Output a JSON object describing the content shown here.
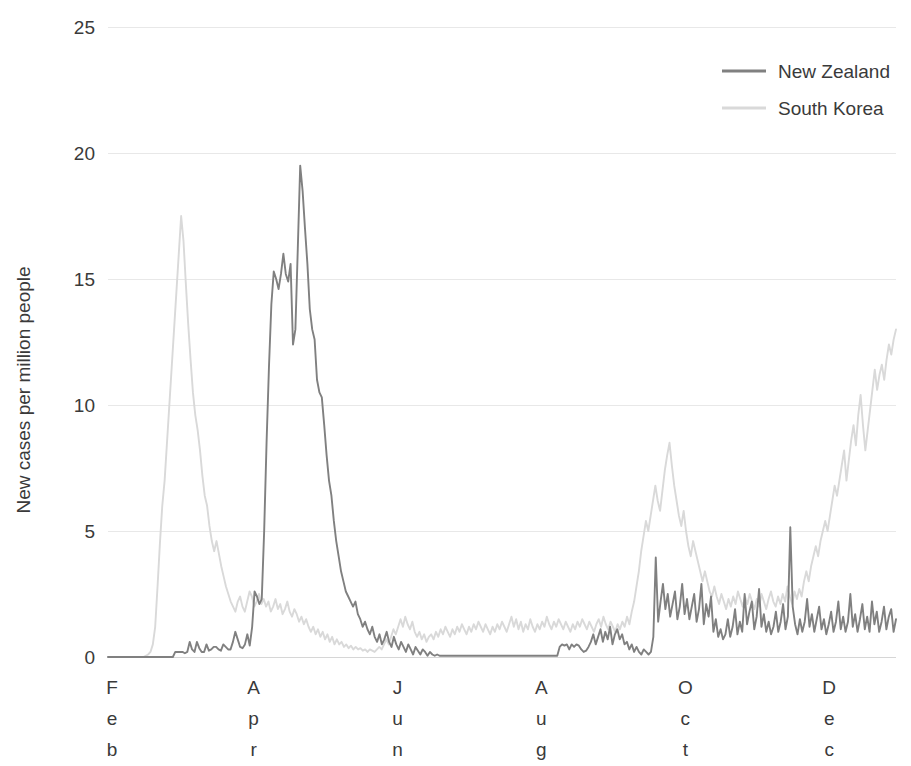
{
  "chart_data": {
    "type": "line",
    "title": "",
    "xlabel": "",
    "ylabel": "New cases per million people",
    "ylim": [
      0,
      25
    ],
    "yticks": [
      0,
      5,
      10,
      15,
      20,
      25
    ],
    "ytick_labels": [
      "0",
      "5",
      "10",
      "15",
      "20",
      "25"
    ],
    "grid": true,
    "grid_axis": "y",
    "legend_position": "top-right",
    "x_axis_type": "date",
    "x_range": [
      "2020-02-01",
      "2020-12-31"
    ],
    "xtick_labels": [
      "Feb",
      "Apr",
      "Jun",
      "Aug",
      "Oct",
      "Dec"
    ],
    "xtick_labels_stacked": [
      [
        "F",
        "e",
        "b"
      ],
      [
        "A",
        "p",
        "r"
      ],
      [
        "J",
        "u",
        "n"
      ],
      [
        "A",
        "u",
        "g"
      ],
      [
        "O",
        "c",
        "t"
      ],
      [
        "D",
        "e",
        "c"
      ]
    ],
    "xtick_positions": [
      0,
      60,
      121,
      182,
      243,
      304
    ],
    "x_total_days": 334,
    "series": [
      {
        "name": "New Zealand",
        "color": "#808080",
        "values": [
          0,
          0,
          0,
          0,
          0,
          0,
          0,
          0,
          0,
          0,
          0,
          0,
          0,
          0,
          0,
          0,
          0,
          0,
          0,
          0,
          0,
          0,
          0,
          0,
          0,
          0,
          0,
          0,
          0.2,
          0.2,
          0.2,
          0.2,
          0.15,
          0.2,
          0.6,
          0.3,
          0.2,
          0.6,
          0.35,
          0.2,
          0.2,
          0.5,
          0.25,
          0.3,
          0.4,
          0.4,
          0.3,
          0.25,
          0.5,
          0.4,
          0.3,
          0.3,
          0.6,
          1.0,
          0.7,
          0.4,
          0.35,
          0.5,
          0.9,
          0.45,
          1.2,
          2.6,
          2.4,
          2.1,
          2.3,
          5.0,
          8.5,
          11.5,
          14.0,
          15.3,
          15.0,
          14.6,
          15.2,
          16.0,
          15.2,
          14.9,
          15.6,
          12.4,
          13.0,
          16.2,
          19.5,
          18.5,
          17.0,
          15.6,
          13.8,
          13.0,
          12.6,
          11.0,
          10.5,
          10.3,
          9.2,
          8.0,
          7.0,
          6.4,
          5.4,
          4.6,
          4.0,
          3.4,
          3.0,
          2.6,
          2.4,
          2.2,
          2.0,
          2.2,
          1.7,
          1.5,
          1.2,
          1.4,
          1.1,
          0.9,
          1.2,
          0.8,
          0.6,
          0.9,
          0.5,
          0.7,
          1.0,
          0.6,
          0.4,
          0.8,
          0.5,
          0.3,
          0.6,
          0.4,
          0.2,
          0.5,
          0.3,
          0.1,
          0.4,
          0.25,
          0.1,
          0.3,
          0.2,
          0.05,
          0.2,
          0.1,
          0.05,
          0.1,
          0.05,
          0.05,
          0.05,
          0.05,
          0.05,
          0.05,
          0.05,
          0.05,
          0.05,
          0.05,
          0.05,
          0.05,
          0.05,
          0.05,
          0.05,
          0.05,
          0.05,
          0.05,
          0.05,
          0.05,
          0.05,
          0.05,
          0.05,
          0.05,
          0.05,
          0.05,
          0.05,
          0.05,
          0.05,
          0.05,
          0.05,
          0.05,
          0.05,
          0.05,
          0.05,
          0.05,
          0.05,
          0.05,
          0.05,
          0.05,
          0.05,
          0.05,
          0.05,
          0.05,
          0.05,
          0.05,
          0.05,
          0.05,
          0.05,
          0.05,
          0.4,
          0.5,
          0.45,
          0.5,
          0.3,
          0.5,
          0.4,
          0.5,
          0.45,
          0.3,
          0.2,
          0.25,
          0.4,
          0.6,
          0.9,
          0.5,
          0.8,
          1.1,
          0.6,
          1.0,
          0.7,
          1.2,
          0.5,
          0.9,
          1.1,
          0.7,
          0.9,
          0.5,
          0.6,
          0.3,
          0.5,
          0.2,
          0.4,
          0.2,
          0.1,
          0.3,
          0.2,
          0.1,
          0.2,
          0.8,
          3.95,
          1.4,
          2.2,
          2.9,
          1.9,
          2.5,
          1.6,
          2.1,
          2.6,
          1.5,
          2.0,
          2.9,
          1.7,
          2.3,
          1.5,
          2.0,
          2.5,
          1.4,
          1.9,
          2.9,
          1.3,
          2.1,
          1.6,
          2.4,
          1.0,
          1.5,
          0.8,
          1.1,
          0.7,
          0.9,
          1.5,
          0.8,
          1.2,
          1.9,
          0.9,
          1.4,
          1.0,
          2.5,
          1.3,
          1.8,
          2.2,
          1.1,
          1.6,
          2.7,
          1.2,
          1.7,
          1.0,
          1.4,
          0.9,
          1.2,
          1.8,
          1.0,
          1.4,
          2.1,
          1.1,
          1.6,
          5.15,
          2.0,
          1.3,
          0.9,
          1.5,
          1.0,
          1.4,
          2.3,
          1.2,
          1.7,
          1.0,
          1.5,
          2.0,
          1.1,
          1.5,
          0.9,
          1.3,
          1.8,
          1.0,
          1.4,
          2.2,
          1.1,
          1.6,
          1.0,
          1.4,
          2.5,
          1.2,
          1.7,
          1.0,
          1.5,
          2.1,
          1.1,
          1.6,
          1.0,
          2.2,
          1.3,
          1.8,
          1.0,
          1.4,
          2.0,
          1.1,
          1.6,
          1.9,
          1.0,
          1.5
        ]
      },
      {
        "name": "South Korea",
        "color": "#d9d9d9",
        "values": [
          0,
          0,
          0,
          0,
          0,
          0,
          0,
          0,
          0,
          0,
          0,
          0,
          0,
          0,
          0,
          0,
          0.05,
          0.1,
          0.2,
          0.5,
          1.2,
          2.8,
          4.5,
          6.0,
          7.0,
          8.5,
          10.0,
          11.5,
          13.0,
          14.5,
          16.0,
          17.5,
          16.5,
          14.8,
          13.2,
          11.8,
          10.5,
          9.6,
          9.0,
          8.2,
          7.2,
          6.4,
          6.0,
          5.2,
          4.6,
          4.2,
          4.6,
          4.1,
          3.6,
          3.2,
          2.8,
          2.5,
          2.2,
          2.0,
          1.8,
          2.2,
          2.4,
          2.0,
          1.8,
          2.2,
          2.6,
          2.4,
          2.0,
          2.2,
          2.5,
          2.1,
          2.3,
          2.0,
          2.2,
          1.8,
          2.0,
          2.3,
          1.9,
          2.1,
          1.7,
          1.9,
          2.2,
          1.8,
          1.6,
          1.9,
          1.7,
          1.4,
          1.6,
          1.3,
          1.5,
          1.2,
          1.0,
          1.2,
          0.9,
          1.1,
          0.8,
          1.0,
          0.7,
          0.9,
          0.6,
          0.8,
          0.5,
          0.7,
          0.5,
          0.6,
          0.4,
          0.5,
          0.35,
          0.45,
          0.3,
          0.4,
          0.3,
          0.35,
          0.25,
          0.3,
          0.2,
          0.3,
          0.25,
          0.2,
          0.3,
          0.4,
          0.3,
          0.5,
          0.7,
          0.5,
          0.8,
          1.1,
          0.9,
          1.2,
          1.5,
          1.2,
          1.6,
          1.3,
          1.1,
          1.4,
          1.0,
          0.8,
          1.0,
          0.7,
          0.9,
          0.6,
          0.8,
          0.9,
          0.7,
          1.0,
          0.8,
          1.1,
          0.9,
          1.2,
          1.0,
          0.8,
          1.1,
          0.9,
          1.2,
          1.0,
          1.3,
          1.1,
          0.9,
          1.2,
          1.0,
          1.3,
          1.1,
          1.4,
          1.2,
          1.0,
          1.3,
          1.1,
          0.9,
          1.2,
          1.0,
          1.3,
          1.1,
          1.4,
          1.2,
          1.0,
          1.3,
          1.6,
          1.2,
          1.5,
          1.1,
          1.4,
          1.0,
          1.3,
          1.1,
          1.5,
          1.2,
          1.0,
          1.3,
          1.1,
          1.4,
          1.2,
          1.6,
          1.3,
          1.1,
          1.4,
          1.2,
          1.5,
          1.3,
          1.1,
          1.4,
          1.2,
          1.0,
          1.3,
          1.1,
          1.4,
          1.2,
          1.5,
          1.3,
          1.1,
          1.4,
          1.2,
          1.0,
          1.3,
          1.5,
          1.2,
          1.6,
          1.3,
          1.1,
          1.4,
          1.2,
          1.0,
          1.3,
          1.1,
          1.4,
          1.2,
          1.6,
          1.3,
          1.8,
          2.2,
          2.8,
          3.4,
          4.2,
          4.8,
          5.4,
          5.0,
          5.6,
          6.2,
          6.8,
          6.2,
          5.8,
          6.6,
          7.4,
          8.0,
          8.5,
          7.6,
          6.8,
          6.2,
          5.6,
          5.2,
          5.8,
          5.0,
          4.4,
          4.0,
          4.6,
          4.2,
          3.8,
          3.4,
          3.0,
          3.4,
          3.0,
          2.6,
          2.4,
          2.8,
          2.4,
          2.1,
          2.5,
          2.2,
          1.9,
          2.3,
          2.0,
          2.4,
          2.1,
          2.6,
          2.3,
          2.0,
          2.4,
          2.1,
          2.5,
          2.2,
          1.9,
          2.3,
          2.0,
          2.5,
          2.2,
          1.9,
          2.3,
          2.6,
          2.2,
          2.0,
          2.4,
          2.1,
          2.5,
          2.2,
          2.8,
          2.4,
          2.1,
          2.6,
          2.3,
          2.7,
          2.4,
          3.0,
          3.4,
          3.0,
          3.6,
          4.0,
          4.4,
          4.0,
          4.6,
          5.0,
          5.4,
          5.0,
          5.6,
          6.2,
          6.8,
          6.4,
          7.0,
          7.6,
          8.2,
          7.0,
          7.8,
          8.6,
          9.2,
          8.4,
          9.6,
          10.4,
          9.2,
          8.2,
          9.0,
          9.8,
          10.6,
          11.4,
          10.6,
          11.2,
          11.6,
          11.0,
          11.8,
          12.4,
          12.0,
          12.6,
          13.0
        ]
      }
    ]
  },
  "legend": {
    "items": [
      {
        "label": "New Zealand",
        "color": "#808080"
      },
      {
        "label": "South Korea",
        "color": "#d9d9d9"
      }
    ]
  },
  "axis": {
    "ylabel": "New cases per million people",
    "ytick_labels": [
      "25",
      "20",
      "15",
      "10",
      "5",
      "0"
    ]
  }
}
